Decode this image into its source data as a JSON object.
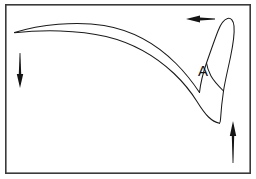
{
  "figure": {
    "type": "line-drawing",
    "background_color": "#ffffff",
    "frame": {
      "name": "figure-border",
      "stroke_color": "#3a3a3a",
      "stroke_width": 1.6,
      "x": 5,
      "y": 4,
      "width": 246,
      "height": 170
    },
    "labels": [
      {
        "id": "label-a",
        "text": "A",
        "x": 203,
        "y": 76,
        "font_size": 15,
        "color": "#101010"
      }
    ],
    "arrows": [
      {
        "id": "arrow-top-right",
        "name": "arrow-pointing-left",
        "direction": "left",
        "color": "#141414",
        "tip_x": 186,
        "tip_y": 19,
        "tail_x": 215,
        "tail_y": 19
      },
      {
        "id": "arrow-left",
        "name": "arrow-pointing-down",
        "direction": "down",
        "color": "#141414",
        "tip_x": 20,
        "tip_y": 88,
        "tail_x": 20,
        "tail_y": 53
      },
      {
        "id": "arrow-bottom-right",
        "name": "arrow-pointing-up",
        "direction": "up",
        "color": "#141414",
        "tip_x": 233,
        "tip_y": 121,
        "tail_x": 233,
        "tail_y": 163
      }
    ],
    "outlines": [
      {
        "id": "outline-upper-edge",
        "name": "upper-contour",
        "stroke_color": "#1a1a1a",
        "stroke_width": 1.05
      },
      {
        "id": "outline-lower-edge",
        "name": "lower-contour",
        "stroke_color": "#1a1a1a",
        "stroke_width": 1.05
      },
      {
        "id": "outline-bulge",
        "name": "bulge-loop-contour",
        "stroke_color": "#1a1a1a",
        "stroke_width": 1.05
      }
    ]
  }
}
